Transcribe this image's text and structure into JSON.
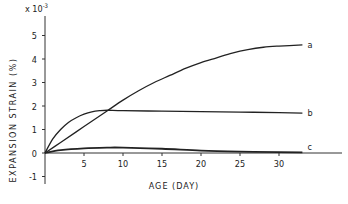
{
  "chart_data": {
    "type": "line",
    "title": "",
    "xlabel": "AGE (DAY)",
    "ylabel": "EXPANSION STRAIN (%)",
    "y_multiplier": "x10^-3",
    "y_multiplier_label": "x 10",
    "y_multiplier_exp": "-3",
    "xlim": [
      0,
      35
    ],
    "ylim": [
      -1.5,
      6
    ],
    "x_ticks": [
      5,
      10,
      15,
      20,
      25,
      30
    ],
    "x_tick_labels": [
      "5",
      "10",
      "15",
      "20",
      "25",
      "30"
    ],
    "y_ticks": [
      -1,
      0,
      1,
      2,
      3,
      4,
      5
    ],
    "y_tick_labels": [
      "-1",
      "0",
      "1",
      "2",
      "3",
      "4",
      "5"
    ],
    "grid": false,
    "legend": "inline labels at line ends",
    "series": [
      {
        "name": "a",
        "x": [
          0,
          2,
          4,
          6,
          8,
          10,
          12,
          14,
          16,
          18,
          20,
          22,
          24,
          26,
          28,
          30,
          33
        ],
        "values": [
          0,
          0.45,
          0.9,
          1.35,
          1.8,
          2.25,
          2.65,
          3.0,
          3.3,
          3.6,
          3.85,
          4.05,
          4.25,
          4.4,
          4.5,
          4.55,
          4.6
        ]
      },
      {
        "name": "b",
        "x": [
          0,
          1,
          2,
          3,
          4,
          5,
          6,
          7,
          8,
          10,
          15,
          20,
          25,
          30,
          33
        ],
        "values": [
          0,
          0.6,
          1.0,
          1.3,
          1.5,
          1.65,
          1.75,
          1.8,
          1.82,
          1.8,
          1.78,
          1.76,
          1.74,
          1.72,
          1.7
        ]
      },
      {
        "name": "c",
        "x": [
          0,
          2,
          5,
          8,
          10,
          15,
          20,
          25,
          30,
          33
        ],
        "values": [
          0,
          0.12,
          0.2,
          0.23,
          0.23,
          0.18,
          0.1,
          0.06,
          0.04,
          0.03
        ]
      }
    ]
  }
}
